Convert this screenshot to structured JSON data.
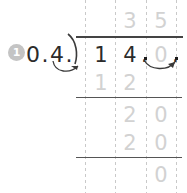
{
  "worksheet": {
    "problem_number": "1",
    "type": "long-division",
    "divisor_text": "0.4.",
    "divisor_digits": [
      "0",
      ".",
      "4",
      "."
    ],
    "quotient": [
      "3",
      "5"
    ],
    "dividend": [
      "1",
      "4",
      ".",
      "0",
      "."
    ],
    "steps": [
      {
        "name": "first-subtraction",
        "digits": [
          "1",
          "2"
        ]
      },
      {
        "name": "first-remainder-bringdown",
        "digits": [
          "2",
          "0"
        ]
      },
      {
        "name": "second-subtraction",
        "digits": [
          "2",
          "0"
        ]
      },
      {
        "name": "final-remainder",
        "digits": [
          "0"
        ]
      }
    ],
    "annotations": {
      "divisor_shift_arrow": "decimal-shift-arrow-left",
      "dividend_shift_arrow": "decimal-shift-arrow-right"
    },
    "colors": {
      "traced_digit": "#d2d2d2",
      "ink": "#2b2b2b",
      "rule": "#555555",
      "guide": "#c9c9c9",
      "badge": "#c4c4c4"
    }
  }
}
